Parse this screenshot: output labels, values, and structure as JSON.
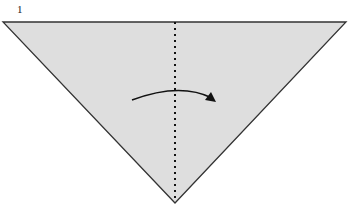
{
  "step": {
    "number": "1"
  },
  "diagram": {
    "shape": "triangle",
    "fill": "#dedede",
    "stroke": "#333333",
    "fold_line": "valley-dotted-vertical",
    "arrow": "fold-right"
  }
}
